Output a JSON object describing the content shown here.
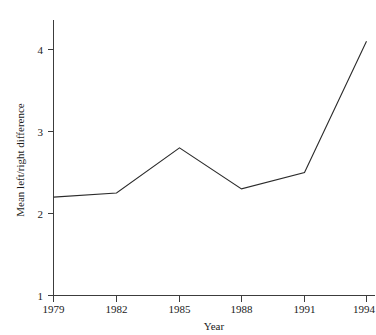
{
  "figure": {
    "clipped_top_text": "",
    "background_color": "#ffffff",
    "line_color": "#2b2b2b",
    "axis_color": "#3c3c3c"
  },
  "axes": {
    "x_title": "Year",
    "y_title": "Mean left/right difference"
  },
  "chart_data": {
    "type": "line",
    "title": "",
    "xlabel": "Year",
    "ylabel": "Mean left/right difference",
    "categories": [
      "1979",
      "1982",
      "1985",
      "1988",
      "1991",
      "1994"
    ],
    "x": [
      1979,
      1982,
      1985,
      1988,
      1991,
      1994
    ],
    "values": [
      2.2,
      2.25,
      2.8,
      2.3,
      2.5,
      4.1
    ],
    "series": [
      {
        "name": "Mean left/right difference",
        "values": [
          2.2,
          2.25,
          2.8,
          2.3,
          2.5,
          4.1
        ]
      }
    ],
    "xlim": [
      1979,
      1994
    ],
    "ylim": [
      1,
      4.35
    ],
    "xticks": [
      "1979",
      "1982",
      "1985",
      "1988",
      "1991",
      "1994"
    ],
    "yticks": [
      "1",
      "2",
      "3",
      "4"
    ],
    "ytick_values": [
      1,
      2,
      3,
      4
    ],
    "grid": false,
    "legend": false,
    "markers": false,
    "line_color": "#2b2b2b"
  }
}
